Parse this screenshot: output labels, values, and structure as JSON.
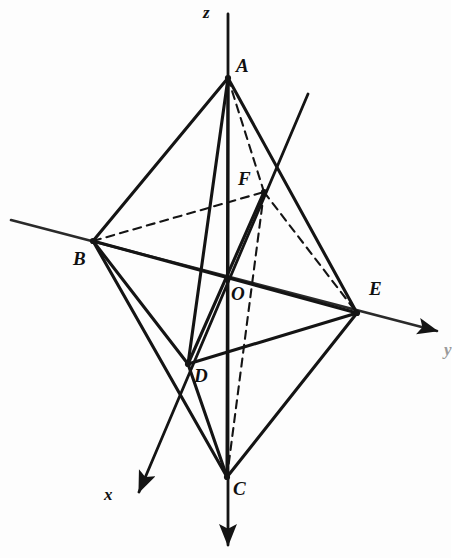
{
  "figure": {
    "stroke_color": "#141414",
    "background_color": "#fdfdfd",
    "canvas": {
      "width": 451,
      "height": 558
    }
  },
  "axes": [
    {
      "name": "z-axis",
      "label": "z",
      "label_x": 203,
      "label_y": 4,
      "x1": 228,
      "y1": 14,
      "x2": 228,
      "y2": 545,
      "arrow": "up",
      "arrow_x": 228,
      "arrow_y": 5,
      "faint": false
    },
    {
      "name": "y-axis",
      "label": "y",
      "label_x": 444,
      "label_y": 341,
      "x1": 11,
      "y1": 220,
      "x2": 437,
      "y2": 331,
      "arrow": "right-down",
      "arrow_x": 446,
      "arrow_y": 333,
      "faint": true
    },
    {
      "name": "x-axis",
      "label": "x",
      "label_x": 104,
      "label_y": 486,
      "x1": 308,
      "y1": 94,
      "x2": 139,
      "y2": 492,
      "arrow": "left-down",
      "arrow_x": 131,
      "arrow_y": 501,
      "faint": false
    }
  ],
  "vertices": [
    {
      "id": "A",
      "label": "A",
      "x": 228,
      "y": 78,
      "label_x": 236,
      "label_y": 56,
      "dot": true
    },
    {
      "id": "B",
      "label": "B",
      "x": 93,
      "y": 241,
      "label_x": 73,
      "label_y": 249,
      "dot": true
    },
    {
      "id": "C",
      "label": "C",
      "x": 227,
      "y": 477,
      "label_x": 233,
      "label_y": 479,
      "dot": true
    },
    {
      "id": "D",
      "label": "D",
      "x": 188,
      "y": 364,
      "label_x": 194,
      "label_y": 366,
      "dot": true
    },
    {
      "id": "E",
      "label": "E",
      "x": 357,
      "y": 313,
      "label_x": 369,
      "label_y": 279,
      "dot": true
    },
    {
      "id": "F",
      "label": "F",
      "x": 264,
      "y": 192,
      "label_x": 238,
      "label_y": 169,
      "dot": true
    },
    {
      "id": "O",
      "label": "O",
      "x": 228,
      "y": 276,
      "label_x": 231,
      "label_y": 284,
      "dot": false
    }
  ],
  "edges_solid": [
    {
      "from": "A",
      "to": "B",
      "x1": 228,
      "y1": 78,
      "x2": 93,
      "y2": 241
    },
    {
      "from": "A",
      "to": "E",
      "x1": 228,
      "y1": 78,
      "x2": 357,
      "y2": 313
    },
    {
      "from": "A",
      "to": "D",
      "x1": 228,
      "y1": 78,
      "x2": 188,
      "y2": 364
    },
    {
      "from": "A",
      "to": "C",
      "x1": 228,
      "y1": 78,
      "x2": 227,
      "y2": 477
    },
    {
      "from": "B",
      "to": "D",
      "x1": 93,
      "y1": 241,
      "x2": 188,
      "y2": 364
    },
    {
      "from": "B",
      "to": "C",
      "x1": 93,
      "y1": 241,
      "x2": 227,
      "y2": 477
    },
    {
      "from": "B",
      "to": "E",
      "x1": 93,
      "y1": 241,
      "x2": 357,
      "y2": 313
    },
    {
      "from": "D",
      "to": "C",
      "x1": 188,
      "y1": 364,
      "x2": 227,
      "y2": 477
    },
    {
      "from": "D",
      "to": "E",
      "x1": 188,
      "y1": 364,
      "x2": 357,
      "y2": 313
    },
    {
      "from": "D",
      "to": "F",
      "x1": 188,
      "y1": 364,
      "x2": 264,
      "y2": 192
    },
    {
      "from": "C",
      "to": "E",
      "x1": 227,
      "y1": 477,
      "x2": 357,
      "y2": 313
    }
  ],
  "edges_dashed": [
    {
      "from": "B",
      "to": "F",
      "x1": 93,
      "y1": 241,
      "x2": 264,
      "y2": 192
    },
    {
      "from": "A",
      "to": "F",
      "x1": 228,
      "y1": 78,
      "x2": 264,
      "y2": 192
    },
    {
      "from": "F",
      "to": "E",
      "x1": 264,
      "y1": 192,
      "x2": 357,
      "y2": 313
    },
    {
      "from": "F",
      "to": "C",
      "x1": 264,
      "y1": 192,
      "x2": 227,
      "y2": 477
    }
  ]
}
